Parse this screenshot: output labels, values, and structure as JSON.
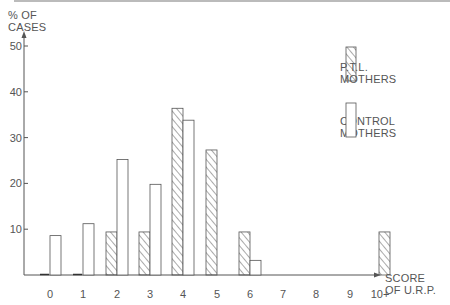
{
  "chart_data": {
    "type": "bar",
    "title": "",
    "ylabel": "% OF CASES",
    "xlabel": "SCORE OF U.R.P.",
    "ylim": [
      0,
      52
    ],
    "yticks": [
      10,
      20,
      30,
      40,
      50
    ],
    "grid": false,
    "legend_position": "upper right",
    "categories": [
      "0",
      "1",
      "2",
      "3",
      "4",
      "5",
      "6",
      "7",
      "8",
      "9",
      "10+"
    ],
    "series": [
      {
        "name": "P.T.L. MOTHERS",
        "pattern": "hatched",
        "values": [
          0,
          0,
          9.4,
          9.4,
          36.4,
          27.3,
          9.4,
          0,
          0,
          0,
          9.4
        ]
      },
      {
        "name": "CONTROL MOTHERS",
        "pattern": "open",
        "values": [
          8.6,
          11.2,
          25.2,
          19.8,
          33.8,
          0,
          3.2,
          0,
          0,
          0,
          0
        ]
      }
    ]
  },
  "axis": {
    "y_label_line1": "% OF",
    "y_label_line2": "CASES",
    "x_label_line1": "SCORE",
    "x_label_line2": "OF U.R.P."
  },
  "legend": {
    "ptl_line1": "P.T.L.",
    "ptl_line2": "MOTHERS",
    "control_line1": "CONTROL",
    "control_line2": "MOTHERS"
  },
  "colors": {
    "ink": "#555555",
    "background": "#ffffff"
  }
}
